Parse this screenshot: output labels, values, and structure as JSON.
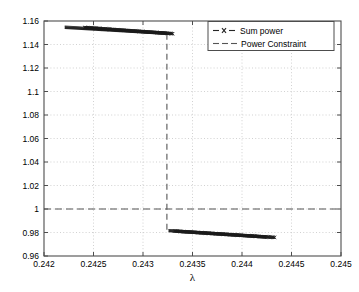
{
  "chart_data": {
    "type": "line",
    "title": "",
    "xlabel": "λ",
    "ylabel": "",
    "xlim": [
      0.242,
      0.245
    ],
    "ylim": [
      0.96,
      1.16
    ],
    "grid": true,
    "grid_style": "dotted",
    "legend_position": "top-right",
    "xticks": [
      0.242,
      0.2425,
      0.243,
      0.2435,
      0.244,
      0.2445,
      0.245
    ],
    "xticklabels": [
      "0.242",
      "0.2425",
      "0.243",
      "0.2435",
      "0.244",
      "0.2445",
      "0.245"
    ],
    "yticks": [
      0.96,
      0.98,
      1.0,
      1.02,
      1.04,
      1.06,
      1.08,
      1.1,
      1.12,
      1.14,
      1.16
    ],
    "yticklabels": [
      "0.96",
      "0.98",
      "1",
      "1.02",
      "1.04",
      "1.06",
      "1.08",
      "1.1",
      "1.12",
      "1.14",
      "1.16"
    ],
    "series": [
      {
        "name": "Sum power",
        "style": "dashed-with-x-markers",
        "color": "#1a1a1a",
        "marker": "x",
        "segments": [
          {
            "comment": "upper branch before constraint jump",
            "x": [
              0.24241,
              0.2425,
              0.2426,
              0.2427,
              0.2428,
              0.2429,
              0.243,
              0.2431,
              0.2432,
              0.2433
            ],
            "y": [
              1.1545,
              1.154,
              1.1534,
              1.1528,
              1.1522,
              1.1516,
              1.151,
              1.1504,
              1.1498,
              1.1492
            ]
          },
          {
            "comment": "lower branch after constraint jump",
            "x": [
              0.24332,
              0.2434,
              0.2435,
              0.2436,
              0.2437,
              0.2438,
              0.2439,
              0.244,
              0.2441,
              0.2442,
              0.24433
            ],
            "y": [
              0.9812,
              0.9808,
              0.9803,
              0.9798,
              0.9793,
              0.9789,
              0.9785,
              0.9781,
              0.9777,
              0.9773,
              0.9758
            ]
          }
        ],
        "discontinuity": {
          "x": 0.243305,
          "y_from": 1.1492,
          "y_to": 0.9812
        }
      },
      {
        "name": "Power Constraint",
        "style": "dashed",
        "color": "#4d4d4d",
        "type": "horizontal-line",
        "value": 1.0
      }
    ]
  },
  "legend": {
    "entries": [
      {
        "label": "Sum power",
        "marker": "x",
        "dash": true
      },
      {
        "label": "Power Constraint",
        "marker": "none",
        "dash": true
      }
    ]
  },
  "axes": {
    "xlabel": "λ"
  }
}
